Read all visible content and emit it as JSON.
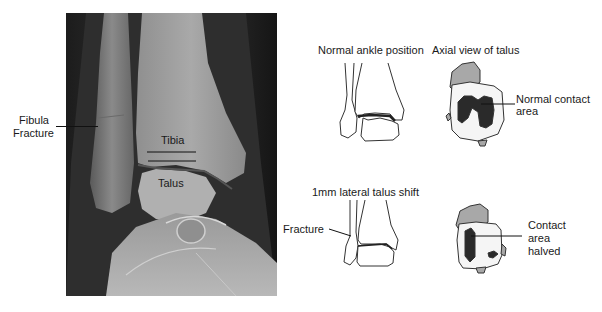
{
  "figure": {
    "xray": {
      "labels": {
        "fibula_fracture_line1": "Fibula",
        "fibula_fracture_line2": "Fracture",
        "tibia": "Tibia",
        "talus": "Talus"
      }
    },
    "panels": {
      "normal": {
        "title": "Normal ankle position",
        "axial_title": "Axial view of talus",
        "contact_label_line1": "Normal contact",
        "contact_label_line2": "area"
      },
      "shifted": {
        "title": "1mm lateral talus shift",
        "fracture_label": "Fracture",
        "contact_label_line1": "Contact",
        "contact_label_line2": "area",
        "contact_label_line3": "halved"
      }
    },
    "colors": {
      "contact_area": "#2a2a2a",
      "talus_posterior": "#a8a8a8",
      "outline": "#333333"
    }
  }
}
